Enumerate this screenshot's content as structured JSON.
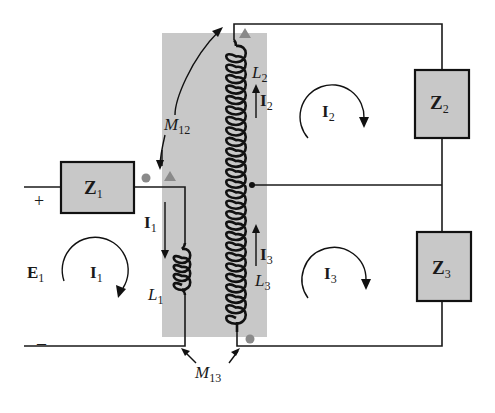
{
  "diagram": {
    "type": "circuit-schematic",
    "colors": {
      "core_shading": "#c8c8c8",
      "impedance_fill": "#c8c8c8",
      "wire": "#1a1a1a",
      "dot_marker": "#8a8a8a"
    },
    "source": {
      "name": "E",
      "subscript": "1",
      "plus": "+",
      "minus": "–"
    },
    "impedances": [
      {
        "name": "Z",
        "subscript": "1"
      },
      {
        "name": "Z",
        "subscript": "2"
      },
      {
        "name": "Z",
        "subscript": "3"
      }
    ],
    "inductors": [
      {
        "name": "L",
        "subscript": "1"
      },
      {
        "name": "L",
        "subscript": "2"
      },
      {
        "name": "L",
        "subscript": "3"
      }
    ],
    "mutual_inductances": [
      {
        "name": "M",
        "subscript": "12"
      },
      {
        "name": "M",
        "subscript": "13"
      }
    ],
    "branch_currents": [
      {
        "name": "I",
        "subscript": "1",
        "direction": "down"
      },
      {
        "name": "I",
        "subscript": "2",
        "direction": "up"
      },
      {
        "name": "I",
        "subscript": "3",
        "direction": "up"
      }
    ],
    "mesh_currents": [
      {
        "name": "I",
        "subscript": "1",
        "direction": "clockwise"
      },
      {
        "name": "I",
        "subscript": "2",
        "direction": "clockwise"
      },
      {
        "name": "I",
        "subscript": "3",
        "direction": "clockwise"
      }
    ],
    "polarity_markers": [
      {
        "shape": "dot",
        "coil": "L1"
      },
      {
        "shape": "triangle",
        "coil": "L1"
      },
      {
        "shape": "triangle",
        "coil": "L2"
      },
      {
        "shape": "dot",
        "coil": "L3"
      }
    ]
  }
}
